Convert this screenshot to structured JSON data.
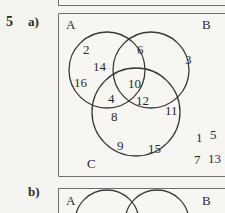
{
  "exercise": {
    "number": "5",
    "part_a_label": "a)",
    "part_b_label": "b)"
  },
  "colors": {
    "paper": "#f6f4f1",
    "box_background": "#f8f6f3",
    "ink": "#2b2b2b",
    "box_border": "#6e6e6e",
    "circle_stroke": "#3a3a3a"
  },
  "diagram_a": {
    "type": "venn",
    "set_labels": {
      "A": "A",
      "B": "B",
      "C": "C"
    },
    "regions": {
      "A_only": [
        "2",
        "14",
        "16"
      ],
      "B_only": [
        "3"
      ],
      "C_only": [
        "9",
        "15"
      ],
      "A_and_B": [
        "6"
      ],
      "A_and_C": [
        "4",
        "8"
      ],
      "B_and_C": [
        "11"
      ],
      "A_and_B_and_C": [
        "10",
        "12"
      ],
      "outside": [
        "1",
        "5",
        "7",
        "13"
      ]
    },
    "elements": [
      {
        "name": "label-A",
        "text": "A",
        "x": 66,
        "y": 18
      },
      {
        "name": "label-B",
        "text": "B",
        "x": 202,
        "y": 18
      },
      {
        "name": "label-C",
        "text": "C",
        "x": 87,
        "y": 157
      },
      {
        "name": "num-2",
        "text": "2",
        "x": 83,
        "y": 43
      },
      {
        "name": "num-14",
        "text": "14",
        "x": 93,
        "y": 60
      },
      {
        "name": "num-16",
        "text": "16",
        "x": 74,
        "y": 76
      },
      {
        "name": "num-6",
        "text": "6",
        "x": 137,
        "y": 43
      },
      {
        "name": "num-3",
        "text": "3",
        "x": 185,
        "y": 53
      },
      {
        "name": "num-10",
        "text": "10",
        "x": 128,
        "y": 77
      },
      {
        "name": "num-4",
        "text": "4",
        "x": 108,
        "y": 92
      },
      {
        "name": "num-12",
        "text": "12",
        "x": 136,
        "y": 94
      },
      {
        "name": "num-8",
        "text": "8",
        "x": 111,
        "y": 110
      },
      {
        "name": "num-11",
        "text": "11",
        "x": 165,
        "y": 104
      },
      {
        "name": "num-9",
        "text": "9",
        "x": 117,
        "y": 139
      },
      {
        "name": "num-15",
        "text": "15",
        "x": 148,
        "y": 142
      },
      {
        "name": "num-1",
        "text": "1",
        "x": 196,
        "y": 131
      },
      {
        "name": "num-5",
        "text": "5",
        "x": 210,
        "y": 128
      },
      {
        "name": "num-7",
        "text": "7",
        "x": 194,
        "y": 153
      },
      {
        "name": "num-13",
        "text": "13",
        "x": 208,
        "y": 152
      }
    ],
    "circles": [
      {
        "name": "circle-A",
        "cx": 107,
        "cy": 70,
        "r": 38
      },
      {
        "name": "circle-B",
        "cx": 151,
        "cy": 70,
        "r": 38
      },
      {
        "name": "circle-C",
        "cx": 136,
        "cy": 112,
        "r": 44
      }
    ]
  },
  "diagram_b": {
    "type": "venn",
    "set_labels": {
      "A": "A",
      "B": "B"
    },
    "circles": [
      {
        "name": "circle-A",
        "cx": 107,
        "cy": 222,
        "r": 32
      },
      {
        "name": "circle-B",
        "cx": 157,
        "cy": 222,
        "r": 32
      }
    ],
    "elements": [
      {
        "name": "label-A",
        "text": "A",
        "x": 66,
        "y": 194
      },
      {
        "name": "label-B",
        "text": "B",
        "x": 202,
        "y": 194
      }
    ]
  }
}
